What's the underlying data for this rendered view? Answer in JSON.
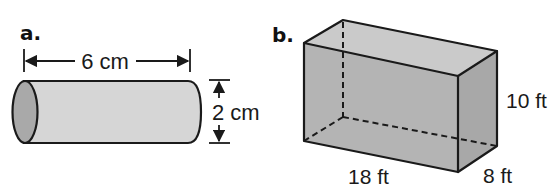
{
  "figures": {
    "a": {
      "label": "a.",
      "shape": "cylinder",
      "length_label": "6 cm",
      "diameter_label": "2 cm",
      "colors": {
        "body": "#d6d6d6",
        "end_face": "#a9a9a9",
        "stroke": "#1a1a1a"
      }
    },
    "b": {
      "label": "b.",
      "shape": "rectangular-prism",
      "height_label": "10 ft",
      "length_label": "18 ft",
      "width_label": "8 ft",
      "colors": {
        "top": "#c8c8c8",
        "front": "#b3b3b3",
        "side": "#a6a6a6",
        "stroke": "#1a1a1a"
      }
    }
  }
}
